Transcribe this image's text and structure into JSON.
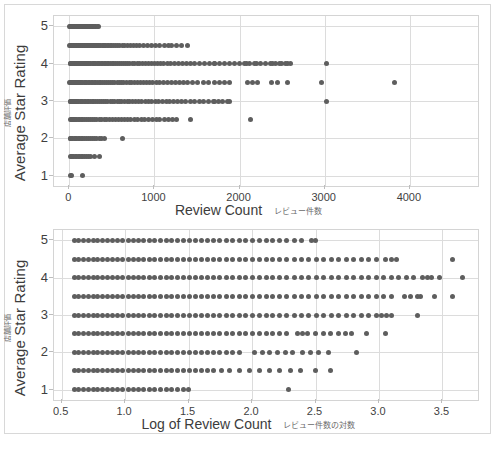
{
  "page": {
    "background": "#ffffff",
    "frame_border_color": "#d8d8d8"
  },
  "charts": [
    {
      "id": "chart-top",
      "ytitle_en": "Average Star Rating",
      "ytitle_jp": "店舗評価",
      "xtitle_en": "Review Count",
      "xtitle_jp": "レビュー件数"
    },
    {
      "id": "chart-bottom",
      "ytitle_en": "Average Star Rating",
      "ytitle_jp": "店舗評価",
      "xtitle_en": "Log of Review Count",
      "xtitle_jp": "レビュー件数の対数"
    }
  ],
  "chart_data": [
    {
      "type": "scatter",
      "title": "",
      "xlabel": "Review Count  レビュー件数",
      "ylabel": "Average Star Rating  店舗評価",
      "xlim": [
        -180,
        4800
      ],
      "ylim": [
        0.72,
        5.28
      ],
      "xticks": [
        0,
        1000,
        2000,
        3000,
        4000
      ],
      "xticklabels": [
        "0",
        "1000",
        "2000",
        "3000",
        "4000"
      ],
      "yticks": [
        1,
        2,
        3,
        4,
        5
      ],
      "yticklabels": [
        "1",
        "2",
        "3",
        "4",
        "5"
      ],
      "grid": true,
      "marker_color": "#5e5e5e",
      "marker_size": 5,
      "legend": null,
      "series": [
        {
          "name": "Stores",
          "note": "Average star rating (0.5 increments) vs raw review count. Each level is a dense horizontal band of points concentrated near low review counts with a long right tail.",
          "points_by_rating": [
            {
              "rating": 5.0,
              "x": [
                5,
                12,
                18,
                24,
                30,
                36,
                42,
                48,
                54,
                60,
                66,
                72,
                78,
                84,
                90,
                96,
                102,
                108,
                114,
                120,
                126,
                132,
                138,
                144,
                150,
                156,
                162,
                168,
                174,
                180,
                186,
                192,
                198,
                204,
                210,
                216,
                222,
                228,
                234,
                240,
                248,
                256,
                264,
                272,
                280,
                290,
                300,
                312,
                325,
                338
              ]
            },
            {
              "rating": 4.5,
              "x": [
                6,
                14,
                22,
                30,
                38,
                46,
                54,
                62,
                70,
                78,
                86,
                94,
                102,
                110,
                118,
                126,
                134,
                142,
                150,
                158,
                166,
                174,
                182,
                190,
                198,
                206,
                214,
                222,
                232,
                242,
                252,
                262,
                272,
                282,
                292,
                302,
                312,
                322,
                334,
                346,
                358,
                370,
                384,
                398,
                412,
                428,
                444,
                462,
                480,
                500,
                520,
                542,
                566,
                592,
                620,
                650,
                682,
                716,
                752,
                790,
                830,
                872,
                916,
                962,
                1010,
                1060,
                1112,
                1166,
                1205,
                1255,
                1320,
                1385
              ]
            },
            {
              "rating": 4.0,
              "x": [
                8,
                16,
                24,
                32,
                40,
                50,
                60,
                70,
                80,
                90,
                100,
                110,
                120,
                130,
                142,
                154,
                166,
                178,
                190,
                202,
                214,
                226,
                240,
                254,
                268,
                282,
                296,
                310,
                326,
                342,
                358,
                374,
                390,
                408,
                426,
                444,
                462,
                482,
                502,
                522,
                544,
                566,
                588,
                612,
                636,
                660,
                686,
                712,
                740,
                768,
                798,
                828,
                860,
                892,
                926,
                960,
                996,
                1032,
                1070,
                1110,
                1150,
                1192,
                1236,
                1280,
                1326,
                1374,
                1424,
                1475,
                1530,
                1586,
                1644,
                1700,
                1705,
                1760,
                1820,
                1880,
                1940,
                2000,
                2060,
                2080,
                2120,
                2180,
                2200,
                2240,
                2300,
                2360,
                2390,
                2420,
                2470,
                2490,
                2540,
                2560,
                2600,
                3020
              ]
            },
            {
              "rating": 3.5,
              "x": [
                7,
                15,
                23,
                31,
                40,
                50,
                60,
                70,
                82,
                94,
                106,
                118,
                132,
                146,
                160,
                174,
                190,
                206,
                222,
                238,
                256,
                274,
                292,
                310,
                330,
                350,
                370,
                392,
                414,
                436,
                460,
                484,
                508,
                534,
                560,
                586,
                614,
                642,
                672,
                702,
                734,
                766,
                800,
                834,
                870,
                906,
                944,
                982,
                1022,
                1064,
                1106,
                1150,
                1195,
                1242,
                1290,
                1340,
                1392,
                1450,
                1510,
                1570,
                1640,
                1700,
                1760,
                1820,
                1880,
                2090,
                2150,
                2210,
                2380,
                2440,
                2560,
                2960,
                3820
              ]
            },
            {
              "rating": 3.0,
              "x": [
                9,
                18,
                28,
                38,
                48,
                60,
                72,
                84,
                98,
                112,
                126,
                142,
                158,
                174,
                192,
                210,
                228,
                248,
                268,
                288,
                310,
                332,
                354,
                378,
                402,
                426,
                452,
                478,
                504,
                532,
                560,
                588,
                618,
                648,
                680,
                712,
                746,
                780,
                816,
                852,
                890,
                928,
                968,
                1008,
                1050,
                1092,
                1136,
                1180,
                1226,
                1272,
                1320,
                1370,
                1420,
                1472,
                1525,
                1580,
                1636,
                1694,
                1700,
                1750,
                1800,
                1860,
                1880,
                3020
              ]
            },
            {
              "rating": 2.5,
              "x": [
                10,
                20,
                32,
                44,
                58,
                72,
                88,
                104,
                122,
                140,
                160,
                180,
                202,
                224,
                248,
                272,
                298,
                324,
                352,
                380,
                410,
                440,
                472,
                504,
                538,
                572,
                608,
                644,
                682,
                720,
                760,
                800,
                842,
                884,
                928,
                972,
                1018,
                1064,
                1112,
                1160,
                1210,
                1260,
                1420,
                2130
              ]
            },
            {
              "rating": 2.0,
              "x": [
                8,
                18,
                30,
                42,
                56,
                70,
                86,
                102,
                120,
                138,
                158,
                178,
                200,
                222,
                246,
                270,
                296,
                322,
                350,
                378,
                408,
                620
              ]
            },
            {
              "rating": 1.5,
              "x": [
                12,
                24,
                38,
                52,
                68,
                84,
                102,
                120,
                140,
                160,
                182,
                204,
                228,
                252,
                300,
                350
              ]
            },
            {
              "rating": 1.0,
              "x": [
                10,
                30,
                160
              ]
            }
          ]
        }
      ]
    },
    {
      "type": "scatter",
      "title": "",
      "xlabel": "Log of Review Count  レビュー件数の対数",
      "ylabel": "Average Star Rating  店舗評価",
      "xlim": [
        0.44,
        3.78
      ],
      "ylim": [
        0.72,
        5.28
      ],
      "xticks": [
        0.5,
        1.0,
        1.5,
        2.0,
        2.5,
        3.0,
        3.5
      ],
      "xticklabels": [
        "0.5",
        "1.0",
        "1.5",
        "2.0",
        "2.5",
        "3.0",
        "3.5"
      ],
      "yticks": [
        1,
        2,
        3,
        4,
        5
      ],
      "yticklabels": [
        "1",
        "2",
        "3",
        "4",
        "5"
      ],
      "grid": true,
      "marker_color": "#5e5e5e",
      "marker_size": 5,
      "legend": null,
      "series": [
        {
          "name": "Stores",
          "note": "Same data with x = log10(review count). Bands become near-continuous dense lines; upper ratings extend furthest right.",
          "bands": [
            {
              "rating": 5.0,
              "xmin": 0.6,
              "xmax": 2.44,
              "dense_to": 2.4,
              "sparse_x": [
                2.47,
                2.5
              ]
            },
            {
              "rating": 4.5,
              "xmin": 0.6,
              "xmax": 3.14,
              "dense_to": 3.0,
              "sparse_x": [
                3.05,
                3.1,
                3.14,
                3.58
              ]
            },
            {
              "rating": 4.0,
              "xmin": 0.6,
              "xmax": 3.41,
              "dense_to": 3.3,
              "sparse_x": [
                3.34,
                3.38,
                3.41,
                3.48,
                3.66
              ]
            },
            {
              "rating": 3.5,
              "xmin": 0.6,
              "xmax": 3.33,
              "dense_to": 3.15,
              "sparse_x": [
                3.2,
                3.25,
                3.3,
                3.33,
                3.44,
                3.58
              ]
            },
            {
              "rating": 3.0,
              "xmin": 0.6,
              "xmax": 3.1,
              "dense_to": 2.98,
              "sparse_x": [
                3.02,
                3.06,
                3.1,
                3.3
              ]
            },
            {
              "rating": 2.5,
              "xmin": 0.6,
              "xmax": 2.78,
              "dense_to": 2.3,
              "sparse_x": [
                2.36,
                2.4,
                2.44,
                2.5,
                2.56,
                2.62,
                2.68,
                2.74,
                2.78,
                2.9,
                3.05
              ]
            },
            {
              "rating": 2.0,
              "xmin": 0.6,
              "xmax": 2.6,
              "dense_to": 1.95,
              "sparse_x": [
                2.02,
                2.08,
                2.14,
                2.2,
                2.26,
                2.32,
                2.4,
                2.46,
                2.52,
                2.6,
                2.82
              ]
            },
            {
              "rating": 1.5,
              "xmin": 0.6,
              "xmax": 2.42,
              "dense_to": 1.7,
              "sparse_x": [
                1.76,
                1.82,
                1.9,
                1.98,
                2.06,
                2.14,
                2.22,
                2.3,
                2.38,
                2.5,
                2.62
              ]
            },
            {
              "rating": 1.0,
              "xmin": 0.6,
              "xmax": 1.5,
              "dense_to": 1.42,
              "sparse_x": [
                1.46,
                1.5,
                2.29
              ]
            }
          ]
        }
      ]
    }
  ],
  "bottom_caption": ""
}
